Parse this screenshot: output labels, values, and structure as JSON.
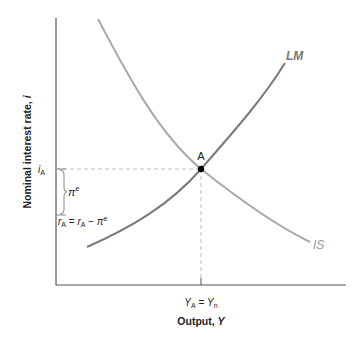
{
  "diagram": {
    "type": "IS-LM",
    "colors": {
      "axis": "#555555",
      "lm_curve": "#7a7a7a",
      "is_curve": "#aaaaaa",
      "dashed_guide": "#bbbbbb",
      "point": "#000000",
      "text": "#222222"
    },
    "axes": {
      "x_label_main": "Output, ",
      "x_label_var": "Y",
      "y_label_main": "Nominal interest rate, ",
      "y_label_var": "i"
    },
    "curves": {
      "lm_label": "LM",
      "is_label": "IS"
    },
    "equilibrium": {
      "point_label": "A",
      "x_tick_left": "Y",
      "x_tick_left_sub": "A",
      "x_tick_eq": " = ",
      "x_tick_right": "Y",
      "x_tick_right_sub": "n",
      "y_tick_i": "i",
      "y_tick_i_sub": "A"
    },
    "annotations": {
      "pi_symbol": "π",
      "pi_sup": "e",
      "real_rate_r1": "r",
      "real_rate_r1_sub": "A",
      "real_rate_eq": " = ",
      "real_rate_r2": "r",
      "real_rate_r2_sub": "A",
      "real_rate_minus": " − ",
      "real_rate_pi": "π",
      "real_rate_pi_sup": "e"
    }
  }
}
